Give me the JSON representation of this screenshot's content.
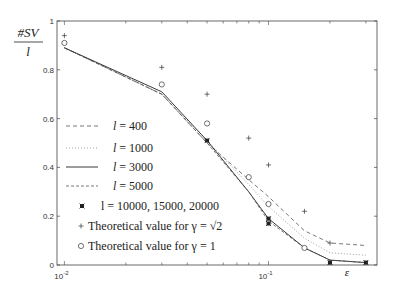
{
  "chart_data": {
    "type": "line",
    "title": "",
    "ylabel_numerator": "#SV",
    "ylabel_denominator": "l",
    "xlabel": "ε",
    "xscale": "log",
    "xlim": [
      0.0092,
      0.34
    ],
    "ylim": [
      0,
      1
    ],
    "grid": false,
    "legend_placement": "bottom-left",
    "x_ticks": [
      {
        "value": 0.01,
        "base": "10",
        "exp": "-2"
      },
      {
        "value": 0.1,
        "base": "10",
        "exp": "-1"
      }
    ],
    "y_ticks": [
      {
        "value": 0,
        "label": "0"
      },
      {
        "value": 0.2,
        "label": "0.2"
      },
      {
        "value": 0.4,
        "label": "0.4"
      },
      {
        "value": 0.6,
        "label": "0.6"
      },
      {
        "value": 0.8,
        "label": "0.8"
      },
      {
        "value": 1,
        "label": "1"
      }
    ],
    "x": [
      0.01,
      0.03,
      0.05,
      0.08,
      0.1,
      0.15,
      0.2,
      0.3
    ],
    "series": [
      {
        "name": "l = 400",
        "style": "dashed",
        "values": [
          0.89,
          0.7,
          0.5,
          0.35,
          0.28,
          0.14,
          0.09,
          0.08
        ]
      },
      {
        "name": "l = 1000",
        "style": "dotted",
        "values": [
          0.89,
          0.7,
          0.51,
          0.33,
          0.24,
          0.11,
          0.05,
          0.04
        ]
      },
      {
        "name": "l = 3000",
        "style": "solid",
        "values": [
          0.89,
          0.71,
          0.51,
          0.3,
          0.19,
          0.07,
          0.02,
          0.01
        ]
      },
      {
        "name": "l = 5000",
        "style": "dashdot",
        "values": [
          0.89,
          0.7,
          0.5,
          0.3,
          0.18,
          0.07,
          0.02,
          0.01
        ]
      }
    ],
    "markers": [
      {
        "name": "l = 10000,  15000,  20000",
        "marker": "asterisk",
        "x": [
          0.05,
          0.1,
          0.1,
          0.2,
          0.3
        ],
        "values": [
          0.51,
          0.19,
          0.17,
          0.01,
          0.01
        ]
      },
      {
        "name": "Theoretical value for γ = √2",
        "marker": "plus",
        "x": [
          0.01,
          0.03,
          0.05,
          0.08,
          0.1,
          0.15,
          0.2
        ],
        "values": [
          0.94,
          0.81,
          0.7,
          0.52,
          0.41,
          0.22,
          0.09
        ]
      },
      {
        "name": "Theoretical value for γ = 1",
        "marker": "circle",
        "x": [
          0.01,
          0.03,
          0.05,
          0.08,
          0.1,
          0.15
        ],
        "values": [
          0.91,
          0.74,
          0.58,
          0.36,
          0.25,
          0.07
        ]
      }
    ]
  }
}
